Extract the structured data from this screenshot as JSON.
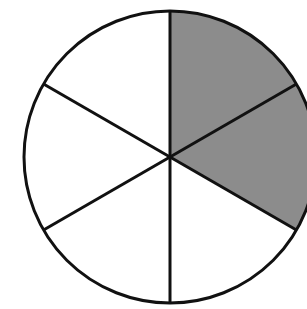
{
  "diagram": {
    "type": "fraction-circle",
    "total_parts": 6,
    "shaded_parts": 2,
    "fraction_shaded": "2/6",
    "colors": {
      "shaded": "#8c8c8c",
      "unshaded": "#ffffff",
      "stroke": "#111111"
    }
  }
}
